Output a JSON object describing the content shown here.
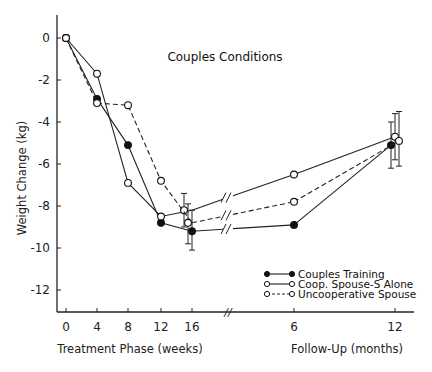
{
  "chart_data": {
    "type": "line",
    "title": "Couples Conditions",
    "ylabel": "Weight Change  (kg)",
    "xlabel_left": "Treatment Phase (weeks)",
    "xlabel_right": "Follow-Up (months)",
    "ylim": [
      -13,
      1
    ],
    "yticks": [
      0,
      -2,
      -4,
      -6,
      -8,
      -10,
      -12
    ],
    "ytick_labels": [
      "0",
      "-2",
      "-4",
      "-6",
      "-8",
      "-10",
      "-12"
    ],
    "x_categories": [
      "0",
      "4",
      "8",
      "12",
      "16",
      "6",
      "12"
    ],
    "x_groups": [
      {
        "name": "Treatment Phase (weeks)",
        "ticks": [
          "0",
          "4",
          "8",
          "12",
          "16"
        ]
      },
      {
        "name": "Follow-Up (months)",
        "ticks": [
          "6",
          "12"
        ]
      }
    ],
    "axis_break": "//",
    "grid": false,
    "legend_position": "lower right",
    "series": [
      {
        "name": "Couples Training",
        "marker": "filled-circle",
        "line": "solid",
        "values": [
          0,
          -2.9,
          -5.1,
          -8.8,
          -9.2,
          -8.9,
          -5.1
        ],
        "error_bars": {
          "16": [
            -8.2,
            -10.1
          ],
          "12mo": [
            -4.0,
            -6.2
          ]
        }
      },
      {
        "name": "Coop. Spouse-S Alone",
        "marker": "open-circle",
        "line": "solid",
        "values": [
          0,
          -1.7,
          -6.9,
          -8.5,
          -8.2,
          -6.5,
          -4.7
        ],
        "error_bars": {
          "16": [
            -7.4,
            -9.0
          ],
          "12mo": [
            -3.6,
            -5.8
          ]
        }
      },
      {
        "name": "Uncooperative Spouse",
        "marker": "open-circle",
        "line": "dashed",
        "values": [
          0,
          -3.1,
          -3.2,
          -6.8,
          -8.8,
          -7.8,
          -4.9
        ],
        "error_bars": {
          "16": [
            -7.9,
            -9.8
          ],
          "12mo": [
            -3.5,
            -6.1
          ]
        }
      }
    ]
  },
  "legend": {
    "items": [
      {
        "label": "Couples Training"
      },
      {
        "label": "Coop. Spouse-S Alone"
      },
      {
        "label": "Uncooperative Spouse"
      }
    ]
  }
}
